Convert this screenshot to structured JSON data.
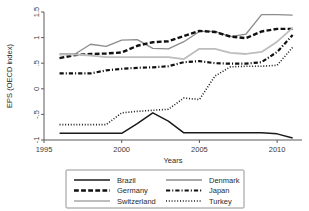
{
  "chart_data": {
    "type": "line",
    "title": "",
    "xlabel": "Years",
    "ylabel": "EPS (OECD index)",
    "xlim": [
      1995,
      2011.6
    ],
    "ylim": [
      -1,
      1.5
    ],
    "xticks": [
      "1995",
      "2000",
      "2005",
      "2010"
    ],
    "xtick_values": [
      1995,
      2000,
      2005,
      2010
    ],
    "yticks": [
      "1.5",
      "1",
      ".5",
      "0",
      "-.5",
      "-1"
    ],
    "ytick_values": [
      1.5,
      1,
      0.5,
      0,
      -0.5,
      -1
    ],
    "grid": false,
    "legend_position": "below",
    "x": [
      1996,
      1997,
      1998,
      1999,
      2000,
      2001,
      2002,
      2003,
      2004,
      2005,
      2006,
      2007,
      2008,
      2009,
      2010,
      2011
    ],
    "series": [
      {
        "name": "Brazil",
        "color": "#1a1a1a",
        "style": "solid",
        "width": 1.5,
        "values": [
          -0.87,
          -0.87,
          -0.87,
          -0.87,
          -0.87,
          -0.68,
          -0.47,
          -0.63,
          -0.86,
          -0.86,
          -0.86,
          -0.86,
          -0.86,
          -0.86,
          -0.88,
          -0.96
        ]
      },
      {
        "name": "Denmark",
        "color": "#8c8c8c",
        "style": "solid",
        "width": 1.3,
        "values": [
          0.68,
          0.68,
          0.87,
          0.83,
          0.95,
          0.96,
          0.79,
          0.78,
          0.92,
          1.12,
          1.12,
          1.02,
          1.07,
          1.45,
          1.45,
          1.44
        ]
      },
      {
        "name": "Germany",
        "color": "#111111",
        "style": "dashed",
        "width": 2.4,
        "values": [
          0.6,
          0.66,
          0.68,
          0.69,
          0.71,
          0.84,
          0.91,
          0.93,
          1.03,
          1.13,
          1.11,
          1.02,
          0.99,
          1.12,
          1.17,
          1.17
        ]
      },
      {
        "name": "Japan",
        "color": "#111111",
        "style": "dashdot",
        "width": 2.2,
        "values": [
          0.3,
          0.3,
          0.3,
          0.36,
          0.39,
          0.41,
          0.42,
          0.44,
          0.52,
          0.54,
          0.5,
          0.49,
          0.49,
          0.52,
          0.72,
          1.05
        ]
      },
      {
        "name": "Switzerland",
        "color": "#bdbdbd",
        "style": "solid",
        "width": 1.8,
        "values": [
          0.67,
          0.67,
          0.65,
          0.62,
          0.62,
          0.62,
          0.62,
          0.62,
          0.58,
          0.78,
          0.78,
          0.7,
          0.68,
          0.72,
          0.92,
          1.19
        ]
      },
      {
        "name": "Turkey",
        "color": "#1a1a1a",
        "style": "dotted",
        "width": 1.6,
        "values": [
          -0.7,
          -0.7,
          -0.7,
          -0.7,
          -0.47,
          -0.44,
          -0.42,
          -0.4,
          -0.18,
          -0.21,
          0.25,
          0.43,
          0.44,
          0.44,
          0.46,
          0.81
        ]
      }
    ],
    "legend_entries": [
      {
        "label": "Brazil",
        "style": "solid",
        "color": "#1a1a1a",
        "width": 1.5
      },
      {
        "label": "Denmark",
        "style": "solid",
        "color": "#8c8c8c",
        "width": 1.3
      },
      {
        "label": "Germany",
        "style": "dashed",
        "color": "#111111",
        "width": 2.4
      },
      {
        "label": "Japan",
        "style": "dashdot",
        "color": "#111111",
        "width": 2.2
      },
      {
        "label": "Switzerland",
        "style": "solid",
        "color": "#bdbdbd",
        "width": 1.8
      },
      {
        "label": "Turkey",
        "style": "dotted",
        "color": "#1a1a1a",
        "width": 1.6
      }
    ]
  }
}
